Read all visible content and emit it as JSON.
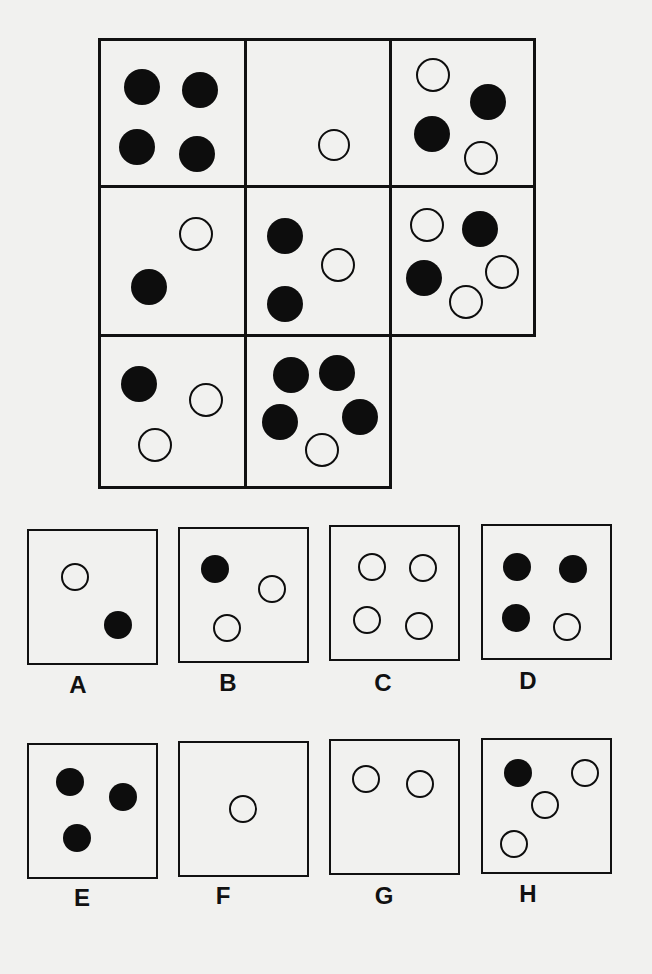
{
  "puzzle": {
    "type": "matrix-reasoning",
    "grid_rows": 3,
    "grid_cols": 3,
    "missing_cell": "row3-col3",
    "matrix": [
      {
        "id": "r1c1",
        "x": 100,
        "y": 40,
        "w": 146,
        "h": 147,
        "dots": [
          {
            "x": 142,
            "y": 87,
            "r": 18,
            "fill": "black"
          },
          {
            "x": 200,
            "y": 90,
            "r": 18,
            "fill": "black"
          },
          {
            "x": 137,
            "y": 147,
            "r": 18,
            "fill": "black"
          },
          {
            "x": 197,
            "y": 154,
            "r": 18,
            "fill": "black"
          }
        ]
      },
      {
        "id": "r1c2",
        "x": 246,
        "y": 40,
        "w": 144,
        "h": 147,
        "dots": [
          {
            "x": 334,
            "y": 145,
            "r": 16,
            "fill": "white"
          }
        ]
      },
      {
        "id": "r1c3",
        "x": 390,
        "y": 40,
        "w": 144,
        "h": 147,
        "dots": [
          {
            "x": 433,
            "y": 75,
            "r": 17,
            "fill": "white"
          },
          {
            "x": 488,
            "y": 102,
            "r": 18,
            "fill": "black"
          },
          {
            "x": 432,
            "y": 134,
            "r": 18,
            "fill": "black"
          },
          {
            "x": 481,
            "y": 158,
            "r": 17,
            "fill": "white"
          }
        ]
      },
      {
        "id": "r2c1",
        "x": 100,
        "y": 187,
        "w": 146,
        "h": 148,
        "dots": [
          {
            "x": 196,
            "y": 234,
            "r": 17,
            "fill": "white"
          },
          {
            "x": 149,
            "y": 287,
            "r": 18,
            "fill": "black"
          }
        ]
      },
      {
        "id": "r2c2",
        "x": 246,
        "y": 187,
        "w": 144,
        "h": 148,
        "dots": [
          {
            "x": 285,
            "y": 236,
            "r": 18,
            "fill": "black"
          },
          {
            "x": 338,
            "y": 265,
            "r": 17,
            "fill": "white"
          },
          {
            "x": 285,
            "y": 304,
            "r": 18,
            "fill": "black"
          }
        ]
      },
      {
        "id": "r2c3",
        "x": 390,
        "y": 187,
        "w": 144,
        "h": 148,
        "dots": [
          {
            "x": 427,
            "y": 225,
            "r": 17,
            "fill": "white"
          },
          {
            "x": 480,
            "y": 229,
            "r": 18,
            "fill": "black"
          },
          {
            "x": 424,
            "y": 278,
            "r": 18,
            "fill": "black"
          },
          {
            "x": 502,
            "y": 272,
            "r": 17,
            "fill": "white"
          },
          {
            "x": 466,
            "y": 302,
            "r": 17,
            "fill": "white"
          }
        ]
      },
      {
        "id": "r3c1",
        "x": 100,
        "y": 335,
        "w": 146,
        "h": 152,
        "dots": [
          {
            "x": 139,
            "y": 384,
            "r": 18,
            "fill": "black"
          },
          {
            "x": 206,
            "y": 400,
            "r": 17,
            "fill": "white"
          },
          {
            "x": 155,
            "y": 445,
            "r": 17,
            "fill": "white"
          }
        ]
      },
      {
        "id": "r3c2",
        "x": 246,
        "y": 335,
        "w": 144,
        "h": 152,
        "dots": [
          {
            "x": 291,
            "y": 375,
            "r": 18,
            "fill": "black"
          },
          {
            "x": 337,
            "y": 373,
            "r": 18,
            "fill": "black"
          },
          {
            "x": 280,
            "y": 422,
            "r": 18,
            "fill": "black"
          },
          {
            "x": 360,
            "y": 417,
            "r": 18,
            "fill": "black"
          },
          {
            "x": 322,
            "y": 450,
            "r": 17,
            "fill": "white"
          }
        ]
      }
    ],
    "options": [
      {
        "label": "A",
        "x": 27,
        "y": 529,
        "w": 131,
        "h": 136,
        "lx": 78,
        "ly": 685,
        "dots": [
          {
            "x": 75,
            "y": 577,
            "r": 14,
            "fill": "white"
          },
          {
            "x": 118,
            "y": 625,
            "r": 14,
            "fill": "black"
          }
        ]
      },
      {
        "label": "B",
        "x": 178,
        "y": 527,
        "w": 131,
        "h": 136,
        "lx": 228,
        "ly": 683,
        "dots": [
          {
            "x": 215,
            "y": 569,
            "r": 14,
            "fill": "black"
          },
          {
            "x": 272,
            "y": 589,
            "r": 14,
            "fill": "white"
          },
          {
            "x": 227,
            "y": 628,
            "r": 14,
            "fill": "white"
          }
        ]
      },
      {
        "label": "C",
        "x": 329,
        "y": 525,
        "w": 131,
        "h": 136,
        "lx": 383,
        "ly": 683,
        "dots": [
          {
            "x": 372,
            "y": 567,
            "r": 14,
            "fill": "white"
          },
          {
            "x": 423,
            "y": 568,
            "r": 14,
            "fill": "white"
          },
          {
            "x": 367,
            "y": 620,
            "r": 14,
            "fill": "white"
          },
          {
            "x": 419,
            "y": 626,
            "r": 14,
            "fill": "white"
          }
        ]
      },
      {
        "label": "D",
        "x": 481,
        "y": 524,
        "w": 131,
        "h": 136,
        "lx": 528,
        "ly": 681,
        "dots": [
          {
            "x": 517,
            "y": 567,
            "r": 14,
            "fill": "black"
          },
          {
            "x": 573,
            "y": 569,
            "r": 14,
            "fill": "black"
          },
          {
            "x": 516,
            "y": 618,
            "r": 14,
            "fill": "black"
          },
          {
            "x": 567,
            "y": 627,
            "r": 14,
            "fill": "white"
          }
        ]
      },
      {
        "label": "E",
        "x": 27,
        "y": 743,
        "w": 131,
        "h": 136,
        "lx": 82,
        "ly": 898,
        "dots": [
          {
            "x": 70,
            "y": 782,
            "r": 14,
            "fill": "black"
          },
          {
            "x": 123,
            "y": 797,
            "r": 14,
            "fill": "black"
          },
          {
            "x": 77,
            "y": 838,
            "r": 14,
            "fill": "black"
          }
        ]
      },
      {
        "label": "F",
        "x": 178,
        "y": 741,
        "w": 131,
        "h": 136,
        "lx": 223,
        "ly": 896,
        "dots": [
          {
            "x": 243,
            "y": 809,
            "r": 14,
            "fill": "white"
          }
        ]
      },
      {
        "label": "G",
        "x": 329,
        "y": 739,
        "w": 131,
        "h": 136,
        "lx": 384,
        "ly": 896,
        "dots": [
          {
            "x": 366,
            "y": 779,
            "r": 14,
            "fill": "white"
          },
          {
            "x": 420,
            "y": 784,
            "r": 14,
            "fill": "white"
          }
        ]
      },
      {
        "label": "H",
        "x": 481,
        "y": 738,
        "w": 131,
        "h": 136,
        "lx": 528,
        "ly": 894,
        "dots": [
          {
            "x": 518,
            "y": 773,
            "r": 14,
            "fill": "black"
          },
          {
            "x": 585,
            "y": 773,
            "r": 14,
            "fill": "white"
          },
          {
            "x": 545,
            "y": 805,
            "r": 14,
            "fill": "white"
          },
          {
            "x": 514,
            "y": 844,
            "r": 14,
            "fill": "white"
          }
        ]
      }
    ]
  }
}
